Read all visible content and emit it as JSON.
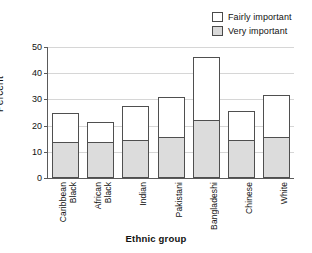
{
  "chart_data": {
    "type": "bar",
    "subtype": "stacked-vertical",
    "title": "",
    "xlabel": "Ethnic group",
    "ylabel": "Percent",
    "ylim": [
      0,
      50
    ],
    "yticks": [
      0,
      10,
      20,
      30,
      40,
      50
    ],
    "grid": true,
    "legend_position": "top-right",
    "categories": [
      "Black Caribbean",
      "Black African",
      "Indian",
      "Pakistani",
      "Bangladeshi",
      "Chinese",
      "White"
    ],
    "category_lines": [
      [
        "Black",
        "Caribbean"
      ],
      [
        "Black",
        "African"
      ],
      [
        "Indian"
      ],
      [
        "Pakistani"
      ],
      [
        "Bangladeshi"
      ],
      [
        "Chinese"
      ],
      [
        "White"
      ]
    ],
    "series": [
      {
        "name": "Very important",
        "color": "#dcdcdc",
        "values": [
          13.7,
          13.8,
          14.5,
          15.6,
          22.4,
          14.6,
          15.6
        ]
      },
      {
        "name": "Fairly important",
        "color": "#ffffff",
        "values": [
          11.1,
          7.7,
          13.1,
          15.3,
          23.6,
          10.9,
          16.2
        ]
      }
    ],
    "totals": [
      24.8,
      21.5,
      27.6,
      30.9,
      46.0,
      25.5,
      31.8
    ]
  },
  "legend": {
    "items": [
      {
        "label": "Fairly important",
        "swatch": "white"
      },
      {
        "label": "Very important",
        "swatch": "gray"
      }
    ]
  },
  "axes": {
    "y_title": "Percent",
    "x_title": "Ethnic group",
    "y_tick_labels": [
      "0",
      "10",
      "20",
      "30",
      "40",
      "50"
    ]
  },
  "colors": {
    "very_important": "#dcdcdc",
    "fairly_important": "#ffffff",
    "bar_outline": "#4f4f4f",
    "axis": "#5a5a5a",
    "gridline": "#d6d6d6",
    "text": "#111111",
    "background": "#ffffff"
  }
}
